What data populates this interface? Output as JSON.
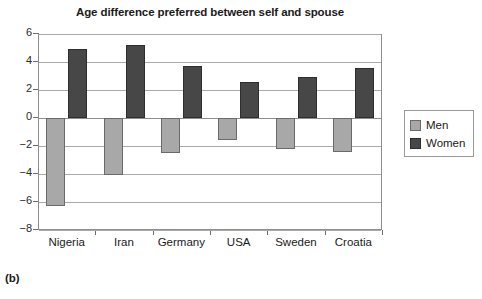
{
  "chart_data": {
    "type": "bar",
    "title": "Age difference preferred between self and spouse",
    "xlabel": "",
    "ylabel": "",
    "categories": [
      "Nigeria",
      "Iran",
      "Germany",
      "USA",
      "Sweden",
      "Croatia"
    ],
    "series": [
      {
        "name": "Men",
        "color": "#a8a8a8",
        "values": [
          -6.3,
          -4.1,
          -2.5,
          -1.6,
          -2.2,
          -2.4
        ]
      },
      {
        "name": "Women",
        "color": "#474747",
        "values": [
          4.9,
          5.2,
          3.7,
          2.6,
          2.9,
          3.6
        ]
      }
    ],
    "ylim": [
      -8,
      6
    ],
    "yticks": [
      6,
      4,
      2,
      0,
      -2,
      -4,
      -6,
      -8
    ],
    "ytick_labels": [
      "6",
      "4",
      "2",
      "0",
      "−2",
      "−4",
      "−6",
      "−8"
    ],
    "grid": true,
    "legend_position": "right"
  },
  "legend": {
    "items": [
      {
        "label": "Men"
      },
      {
        "label": "Women"
      }
    ]
  },
  "caption": {
    "panel_label": "(b)"
  }
}
